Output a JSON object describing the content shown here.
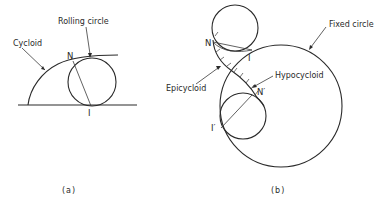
{
  "figure": {
    "panel_a": {
      "caption": "(a)",
      "labels": {
        "cycloid": "Cycloid",
        "rolling_circle": "Rolling circle",
        "point_n": "N",
        "point_i": "I"
      }
    },
    "panel_b": {
      "caption": "(b)",
      "labels": {
        "fixed_circle": "Fixed circle",
        "epicycloid": "Epicycloid",
        "hypocycloid": "Hypocycloid",
        "point_n": "N",
        "point_i": "I",
        "point_n_prime": "N′",
        "point_i_prime": "I′"
      }
    }
  }
}
